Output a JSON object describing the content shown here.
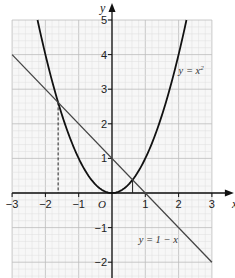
{
  "chart_data": {
    "type": "line",
    "title": "",
    "xlabel": "x",
    "ylabel": "y",
    "xlim": [
      -3,
      3
    ],
    "ylim": [
      -2.3,
      5
    ],
    "grid": true,
    "grid_minor_step": 0.2,
    "grid_major_step": 1,
    "origin_label": "O",
    "x_ticks": [
      -3,
      -2,
      -1,
      1,
      2,
      3
    ],
    "x_tick_labels": [
      "−3",
      "−2",
      "−1",
      "1",
      "2",
      "3"
    ],
    "y_ticks": [
      5,
      4,
      3,
      2,
      1,
      -1,
      -2
    ],
    "y_tick_labels": [
      "5",
      "4",
      "3",
      "2",
      "1",
      "−1",
      "−2"
    ],
    "series": [
      {
        "name": "y = x²",
        "label_text": "y = x",
        "label_sup": "2",
        "formula": "x^2",
        "x_range": [
          -2.236,
          2.236
        ],
        "color": "#111111",
        "label_position": {
          "x": 2.0,
          "y": 3.45
        }
      },
      {
        "name": "y = 1 − x",
        "label_text": "y = 1 − x",
        "formula": "1-x",
        "x_range": [
          -3,
          3
        ],
        "points": [
          [
            -3,
            4
          ],
          [
            3,
            -2
          ]
        ],
        "color": "#444444",
        "label_position": {
          "x": 0.8,
          "y": -1.45
        }
      }
    ],
    "annotations": [
      {
        "type": "dashed-drop-line",
        "x": -1.618,
        "y": 2.618
      },
      {
        "type": "drop-line",
        "x": 0.618,
        "y": 0.382
      }
    ],
    "intersections": [
      [
        -1.618,
        2.618
      ],
      [
        0.618,
        0.382
      ]
    ]
  }
}
